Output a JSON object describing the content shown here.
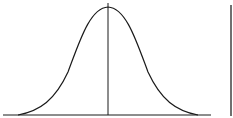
{
  "diagram": {
    "type": "normal-distribution-curve",
    "stroke_color": "#1a1a1a",
    "background": "#ffffff",
    "elements": [
      "bell-curve",
      "baseline-axis",
      "mean-line",
      "right-vertical-line"
    ]
  }
}
